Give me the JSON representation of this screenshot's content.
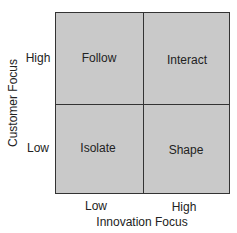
{
  "diagram": {
    "y_axis_label": "Customer Focus",
    "x_axis_label": "Innovation Focus",
    "y_ticks": {
      "high": "High",
      "low": "Low"
    },
    "x_ticks": {
      "low": "Low",
      "high": "High"
    },
    "quadrants": {
      "top_left": "Follow",
      "top_right": "Interact",
      "bottom_left": "Isolate",
      "bottom_right": "Shape"
    },
    "colors": {
      "fill": "#c9c9c9",
      "line": "#333333"
    }
  }
}
